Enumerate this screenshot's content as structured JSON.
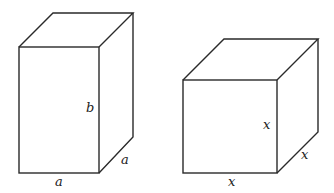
{
  "diagram": {
    "type": "geometry-figure",
    "shapes": [
      {
        "name": "rectangular-prism",
        "labels": {
          "height": "b",
          "width": "a",
          "depth": "a"
        }
      },
      {
        "name": "cube",
        "labels": {
          "height": "x",
          "width": "x",
          "depth": "x"
        }
      }
    ],
    "stroke_color": "#2a2a2a",
    "background": "#ffffff"
  }
}
